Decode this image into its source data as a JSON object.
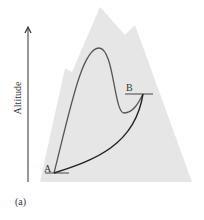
{
  "figure": {
    "panel_label": "(a)",
    "axis_label": "Altitude",
    "point_a_label": "A",
    "point_b_label": "B"
  },
  "colors": {
    "mountain": "#e6e6e6",
    "path_upper": "#555555",
    "path_lower": "#222222",
    "axis": "#333333"
  }
}
